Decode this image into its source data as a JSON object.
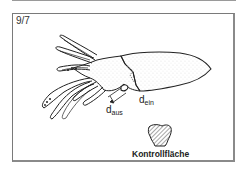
{
  "figure": {
    "number": "9/7",
    "labels": {
      "d_aus": {
        "base": "d",
        "sub": "aus"
      },
      "d_ein": {
        "base": "d",
        "sub": "ein"
      },
      "control_area": "Kontrollfläche"
    },
    "colors": {
      "line": "#222222",
      "frame": "#7a7a7a",
      "background": "#ffffff"
    }
  }
}
